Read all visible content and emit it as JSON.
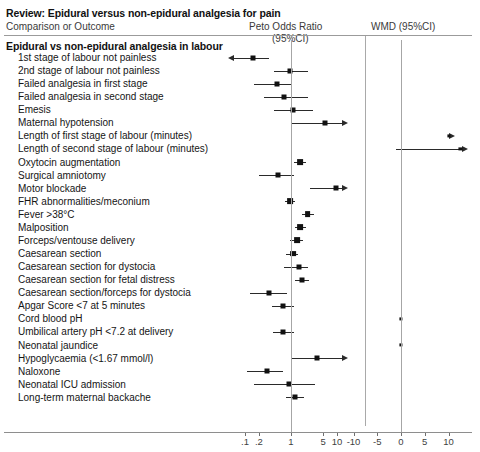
{
  "header": {
    "review_title": "Review: Epidural versus non-epidural analgesia for pain",
    "comparison_label": "Comparison or Outcome",
    "peto_label": "Peto Odds Ratio",
    "peto_sub_label": "(95%CI)",
    "wmd_label": "WMD (95%CI)"
  },
  "group": {
    "title": "Epidural vs non-epidural analgesia in labour"
  },
  "axis": {
    "or": {
      "ticks": [
        ".1",
        ".2",
        "1",
        "5",
        "10"
      ],
      "tick_values": [
        0.1,
        0.2,
        1,
        5,
        10
      ]
    },
    "wmd": {
      "ticks": [
        "-10",
        "-5",
        "0",
        "5",
        "10"
      ],
      "tick_values": [
        -10,
        -5,
        0,
        5,
        10
      ]
    }
  },
  "chart_data": {
    "type": "forest",
    "title": "Review: Epidural versus non-epidural analgesia for pain",
    "subtitle": "Epidural vs non-epidural analgesia in labour",
    "xlabel": "",
    "ylabel": "",
    "panels": [
      {
        "name": "Peto Odds Ratio (95%CI)",
        "scale": "log",
        "null_value": 1,
        "xlim": [
          0.07,
          20
        ]
      },
      {
        "name": "WMD (95%CI)",
        "scale": "linear",
        "null_value": 0,
        "xlim": [
          -14,
          14
        ]
      }
    ],
    "rows": [
      {
        "outcome": "1st stage of labour not painless",
        "panel": "or",
        "estimate": 0.15,
        "ci_low": 0.04,
        "ci_high": 0.33,
        "low_clipped": true,
        "high_clipped": false
      },
      {
        "outcome": "2nd stage of labour not painless",
        "panel": "or",
        "estimate": 0.95,
        "ci_low": 0.42,
        "ci_high": 2.3,
        "low_clipped": false,
        "high_clipped": false
      },
      {
        "outcome": "Failed analgesia in first stage",
        "panel": "or",
        "estimate": 0.5,
        "ci_low": 0.16,
        "ci_high": 1.0,
        "low_clipped": false,
        "high_clipped": false
      },
      {
        "outcome": "Failed analgesia in second stage",
        "panel": "or",
        "estimate": 0.7,
        "ci_low": 0.26,
        "ci_high": 2.3,
        "low_clipped": false,
        "high_clipped": false
      },
      {
        "outcome": "Emesis",
        "panel": "or",
        "estimate": 1.1,
        "ci_low": 0.42,
        "ci_high": 3.0,
        "low_clipped": false,
        "high_clipped": false
      },
      {
        "outcome": "Maternal hypotension",
        "panel": "or",
        "estimate": 5.6,
        "ci_low": 1.0,
        "ci_high": 13.0,
        "low_clipped": false,
        "high_clipped": true
      },
      {
        "outcome": "Length of first stage of labour (minutes)",
        "panel": "wmd",
        "estimate": 10.0,
        "ci_low": 10.0,
        "ci_high": 10.0,
        "low_clipped": false,
        "high_clipped": true
      },
      {
        "outcome": "Length of second stage of labour (minutes)",
        "panel": "wmd",
        "estimate": 12.5,
        "ci_low": -1.0,
        "ci_high": 13.0,
        "low_clipped": false,
        "high_clipped": true
      },
      {
        "outcome": "Oxytocin augmentation",
        "panel": "or",
        "estimate": 1.55,
        "ci_low": 1.15,
        "ci_high": 2.1,
        "low_clipped": false,
        "high_clipped": false
      },
      {
        "outcome": "Surgical amniotomy",
        "panel": "or",
        "estimate": 0.52,
        "ci_low": 0.2,
        "ci_high": 1.15,
        "low_clipped": false,
        "high_clipped": false
      },
      {
        "outcome": "Motor blockade",
        "panel": "or",
        "estimate": 9.5,
        "ci_low": 2.6,
        "ci_high": 13.0,
        "low_clipped": false,
        "high_clipped": true
      },
      {
        "outcome": "FHR abnormalities/meconium",
        "panel": "or",
        "estimate": 0.95,
        "ci_low": 0.75,
        "ci_high": 1.2,
        "low_clipped": false,
        "high_clipped": false
      },
      {
        "outcome": "Fever >38°C",
        "panel": "or",
        "estimate": 2.3,
        "ci_low": 1.7,
        "ci_high": 3.2,
        "low_clipped": false,
        "high_clipped": false
      },
      {
        "outcome": "Malposition",
        "panel": "or",
        "estimate": 1.55,
        "ci_low": 1.2,
        "ci_high": 2.1,
        "low_clipped": false,
        "high_clipped": false
      },
      {
        "outcome": "Forceps/ventouse delivery",
        "panel": "or",
        "estimate": 1.35,
        "ci_low": 0.95,
        "ci_high": 1.8,
        "low_clipped": false,
        "high_clipped": false
      },
      {
        "outcome": "Caesarean section",
        "panel": "or",
        "estimate": 1.1,
        "ci_low": 0.78,
        "ci_high": 1.45,
        "low_clipped": false,
        "high_clipped": false
      },
      {
        "outcome": "Caesarean section for dystocia",
        "panel": "or",
        "estimate": 1.5,
        "ci_low": 0.7,
        "ci_high": 2.4,
        "low_clipped": false,
        "high_clipped": false
      },
      {
        "outcome": "Caesarean section for fetal distress",
        "panel": "or",
        "estimate": 1.7,
        "ci_low": 1.2,
        "ci_high": 2.5,
        "low_clipped": false,
        "high_clipped": false
      },
      {
        "outcome": "Caesarean section/forceps for dystocia",
        "panel": "or",
        "estimate": 0.34,
        "ci_low": 0.13,
        "ci_high": 0.82,
        "low_clipped": false,
        "high_clipped": false
      },
      {
        "outcome": "Apgar Score <7 at 5 minutes",
        "panel": "or",
        "estimate": 0.66,
        "ci_low": 0.38,
        "ci_high": 1.15,
        "low_clipped": false,
        "high_clipped": false
      },
      {
        "outcome": "Cord blood pH",
        "panel": "wmd",
        "estimate": 0.0,
        "ci_low": 0.0,
        "ci_high": 0.0,
        "low_clipped": false,
        "high_clipped": false
      },
      {
        "outcome": "Umbilical artery pH <7.2 at delivery",
        "panel": "or",
        "estimate": 0.66,
        "ci_low": 0.4,
        "ci_high": 1.15,
        "low_clipped": false,
        "high_clipped": false
      },
      {
        "outcome": "Neonatal jaundice",
        "panel": "wmd",
        "estimate": 0.0,
        "ci_low": 0.0,
        "ci_high": 0.0,
        "low_clipped": false,
        "high_clipped": false
      },
      {
        "outcome": "Hypoglycaemia (<1.67 mmol/l)",
        "panel": "or",
        "estimate": 3.6,
        "ci_low": 1.05,
        "ci_high": 13.0,
        "low_clipped": false,
        "high_clipped": true
      },
      {
        "outcome": "Naloxone",
        "panel": "or",
        "estimate": 0.3,
        "ci_low": 0.11,
        "ci_high": 0.68,
        "low_clipped": false,
        "high_clipped": false
      },
      {
        "outcome": "Neonatal ICU admission",
        "panel": "or",
        "estimate": 0.9,
        "ci_low": 0.16,
        "ci_high": 3.4,
        "low_clipped": false,
        "high_clipped": false
      },
      {
        "outcome": "Long-term maternal backache",
        "panel": "or",
        "estimate": 1.2,
        "ci_low": 0.78,
        "ci_high": 1.9,
        "low_clipped": false,
        "high_clipped": false
      }
    ]
  }
}
